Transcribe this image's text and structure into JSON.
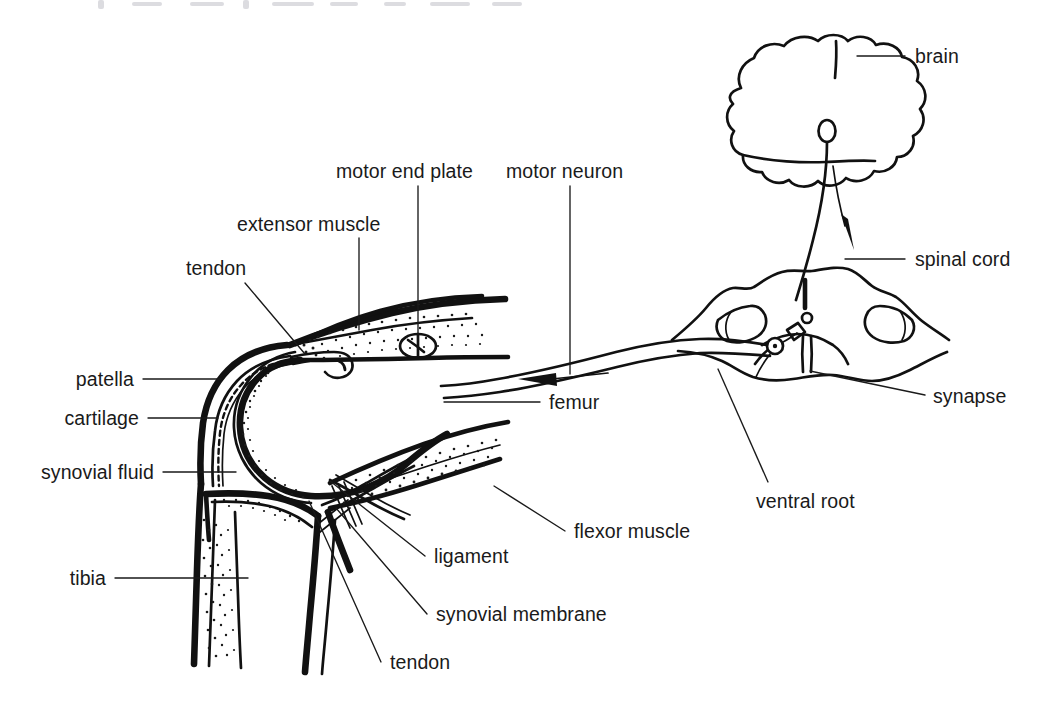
{
  "figure": {
    "background_color": "#ffffff",
    "ink_color": "#111111",
    "label_color": "#1a1a1a"
  },
  "labels": {
    "motor_end_plate": "motor end plate",
    "motor_neuron": "motor neuron",
    "extensor_muscle": "extensor muscle",
    "tendon_top": "tendon",
    "patella": "patella",
    "cartilage": "cartilage",
    "synovial_fluid": "synovial fluid",
    "tibia": "tibia",
    "femur": "femur",
    "flexor_muscle": "flexor muscle",
    "ligament": "ligament",
    "synovial_membrane": "synovial membrane",
    "tendon_bottom": "tendon",
    "brain": "brain",
    "spinal_cord": "spinal cord",
    "synapse": "synapse",
    "ventral_root": "ventral root"
  },
  "parts": [
    {
      "id": "motor-end-plate",
      "label": "motor end plate",
      "group": "neuromuscular",
      "side": "left"
    },
    {
      "id": "motor-neuron",
      "label": "motor neuron",
      "group": "neuromuscular",
      "side": "left"
    },
    {
      "id": "extensor-muscle",
      "label": "extensor muscle",
      "group": "muscle",
      "side": "left"
    },
    {
      "id": "tendon-top",
      "label": "tendon",
      "group": "connective",
      "side": "left"
    },
    {
      "id": "patella",
      "label": "patella",
      "group": "bone",
      "side": "left"
    },
    {
      "id": "cartilage",
      "label": "cartilage",
      "group": "connective",
      "side": "left"
    },
    {
      "id": "synovial-fluid",
      "label": "synovial fluid",
      "group": "joint",
      "side": "left"
    },
    {
      "id": "tibia",
      "label": "tibia",
      "group": "bone",
      "side": "left"
    },
    {
      "id": "femur",
      "label": "femur",
      "group": "bone",
      "side": "left"
    },
    {
      "id": "flexor-muscle",
      "label": "flexor muscle",
      "group": "muscle",
      "side": "left"
    },
    {
      "id": "ligament",
      "label": "ligament",
      "group": "connective",
      "side": "left"
    },
    {
      "id": "synovial-membrane",
      "label": "synovial membrane",
      "group": "joint",
      "side": "left"
    },
    {
      "id": "tendon-bottom",
      "label": "tendon",
      "group": "connective",
      "side": "left"
    },
    {
      "id": "brain",
      "label": "brain",
      "group": "cns",
      "side": "right"
    },
    {
      "id": "spinal-cord",
      "label": "spinal cord",
      "group": "cns",
      "side": "right"
    },
    {
      "id": "synapse",
      "label": "synapse",
      "group": "cns",
      "side": "right"
    },
    {
      "id": "ventral-root",
      "label": "ventral root",
      "group": "cns",
      "side": "right"
    }
  ]
}
